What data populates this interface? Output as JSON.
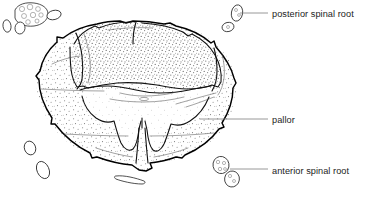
{
  "figure": {
    "type": "anatomical-line-drawing",
    "background_color": "#ffffff",
    "ink_color": "#000000",
    "stipple_color": "#6b6b6b",
    "leader_color": "#7d7d7d",
    "text_color": "#1c1c1c"
  },
  "labels": [
    {
      "id": "posterior-spinal-root",
      "text": "posterior spinal root",
      "x": 272,
      "y": 17,
      "leader": {
        "x1": 240,
        "y1": 13,
        "x2": 268,
        "y2": 13
      }
    },
    {
      "id": "pallor",
      "text": "pallor",
      "x": 272,
      "y": 123,
      "leader": {
        "x1": 200,
        "y1": 119,
        "x2": 268,
        "y2": 119
      }
    },
    {
      "id": "anterior-spinal-root",
      "text": "anterior spinal root",
      "x": 272,
      "y": 174,
      "leader": {
        "x1": 230,
        "y1": 169,
        "x2": 268,
        "y2": 169
      }
    }
  ],
  "structures": [
    {
      "id": "white-matter-anterior-left",
      "region": "anterolateral funiculus, left"
    },
    {
      "id": "white-matter-anterior-right",
      "region": "anterolateral funiculus, right"
    },
    {
      "id": "posterior-columns",
      "region": "posterior funiculi (densely stippled)"
    },
    {
      "id": "gray-matter-butterfly",
      "region": "central gray matter, pale (pallor)"
    },
    {
      "id": "anterior-median-fissure",
      "region": "anterior median fissure"
    },
    {
      "id": "central-canal",
      "region": "central canal region"
    }
  ],
  "nerve_roots": [
    {
      "id": "root-cluster-top-left",
      "cx": 30,
      "cy": 14,
      "rx": 17,
      "ry": 11,
      "kind": "bundle-fascicles"
    },
    {
      "id": "root-small-left-a",
      "cx": 7,
      "cy": 26,
      "rx": 4,
      "ry": 6,
      "kind": "single"
    },
    {
      "id": "root-small-left-b",
      "cx": 19,
      "cy": 27,
      "rx": 5,
      "ry": 6,
      "kind": "single"
    },
    {
      "id": "root-upper-mid",
      "cx": 54,
      "cy": 15,
      "rx": 7,
      "ry": 4.5,
      "kind": "single"
    },
    {
      "id": "root-posterior-upper",
      "cx": 237,
      "cy": 13,
      "rx": 5.5,
      "ry": 8,
      "kind": "single"
    },
    {
      "id": "root-posterior-lower",
      "cx": 229,
      "cy": 27,
      "rx": 6,
      "ry": 4.5,
      "kind": "single"
    },
    {
      "id": "root-lower-left-a",
      "cx": 30,
      "cy": 148,
      "rx": 5.5,
      "ry": 7,
      "kind": "single"
    },
    {
      "id": "root-lower-left-b",
      "cx": 43,
      "cy": 170,
      "rx": 6,
      "ry": 9,
      "kind": "single"
    },
    {
      "id": "root-sliver-bottom",
      "cx": 130,
      "cy": 180,
      "rx": 14,
      "ry": 3,
      "kind": "sliver"
    },
    {
      "id": "root-anterior-a",
      "cx": 222,
      "cy": 165,
      "rx": 8,
      "ry": 8.5,
      "kind": "single"
    },
    {
      "id": "root-anterior-b",
      "cx": 232,
      "cy": 178,
      "rx": 7.5,
      "ry": 8,
      "kind": "single"
    }
  ]
}
